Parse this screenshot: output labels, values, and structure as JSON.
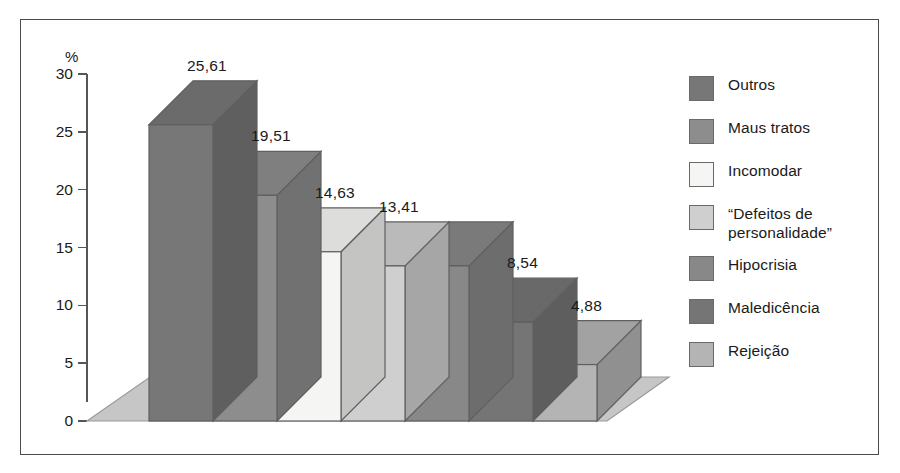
{
  "figure": {
    "unit_label": "%",
    "background_color": "#ffffff",
    "frame_color": "#4a4a4a"
  },
  "axis": {
    "tick_labels": [
      "30",
      "25",
      "20",
      "15",
      "10",
      "5",
      "0"
    ],
    "tick_values": [
      30,
      25,
      20,
      15,
      10,
      5,
      0
    ],
    "min": 0,
    "max": 30,
    "step": 5,
    "line_color": "#565656"
  },
  "legend": {
    "items": [
      {
        "label": "Outros",
        "label_line2": "",
        "color": "#777777"
      },
      {
        "label": "Maus tratos",
        "label_line2": "",
        "color": "#8d8d8d"
      },
      {
        "label": "Incomodar",
        "label_line2": "",
        "color": "#f5f5f3"
      },
      {
        "label": "“Defeitos de",
        "label_line2": "personalidade”",
        "color": "#cfcfcf"
      },
      {
        "label": "Hipocrisia",
        "label_line2": "",
        "color": "#888888"
      },
      {
        "label": "Maledicência",
        "label_line2": "",
        "color": "#757575"
      },
      {
        "label": "Rejeição",
        "label_line2": "",
        "color": "#b4b4b4"
      }
    ]
  },
  "chart_data": {
    "type": "bar",
    "title": "",
    "subtitle": "",
    "xlabel": "",
    "ylabel": "%",
    "ylim": [
      0,
      30
    ],
    "yticks": [
      0,
      5,
      10,
      15,
      20,
      25,
      30
    ],
    "grid": false,
    "legend_position": "right",
    "three_dimensional": true,
    "decimal_separator": ",",
    "categories": [
      "Outros",
      "Maus tratos",
      "Incomodar",
      "“Defeitos de personalidade”",
      "Hipocrisia",
      "Maledicência",
      "Rejeição"
    ],
    "values": [
      25.61,
      19.51,
      14.63,
      13.41,
      13.41,
      8.54,
      4.88
    ],
    "data_labels": [
      "25,61",
      "19,51",
      "14,63",
      "13,41",
      "",
      "8,54",
      "4,88"
    ],
    "colors": [
      "#777777",
      "#8d8d8d",
      "#f5f5f3",
      "#cfcfcf",
      "#888888",
      "#757575",
      "#b4b4b4"
    ]
  }
}
